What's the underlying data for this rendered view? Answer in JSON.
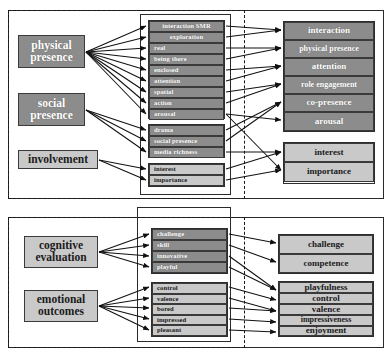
{
  "diagram": {
    "type": "path-diagram",
    "colors": {
      "dark_box": "#8c8c8c",
      "light_box": "#c9c9c9",
      "box_border": "#3a3a3a",
      "frame_solid": "#2a2a2a",
      "frame_dashed": "#1a1a1a",
      "arrow": "#111111",
      "dark_box_text": "#ffffff",
      "light_box_text": "#1b1b1b",
      "background": "#ffffff"
    }
  },
  "panels": [
    {
      "id": "top-panel",
      "latent_variables": [
        {
          "id": "physical-presence",
          "label_line1": "physical",
          "label_line2": "presence",
          "shade": "dark"
        },
        {
          "id": "social-presence",
          "label_line1": "social",
          "label_line2": "presence",
          "shade": "dark"
        },
        {
          "id": "involvement",
          "label_line1": "involvement",
          "label_line2": "",
          "shade": "light"
        }
      ],
      "indicator_groups": [
        {
          "id": "presence-indicators",
          "shade": "dark",
          "items": [
            {
              "id": "interaction-smr",
              "label": "interaction SMR"
            },
            {
              "id": "exploration",
              "label": "exploration"
            },
            {
              "id": "real",
              "label": "real"
            },
            {
              "id": "being-there",
              "label": "being there"
            },
            {
              "id": "enclosed",
              "label": "enclosed"
            },
            {
              "id": "attention",
              "label": "attention"
            },
            {
              "id": "spatial",
              "label": "spatial"
            },
            {
              "id": "action",
              "label": "action"
            },
            {
              "id": "arousal",
              "label": "arousal"
            }
          ]
        },
        {
          "id": "social-indicators",
          "shade": "dark",
          "items": [
            {
              "id": "drama",
              "label": "drama"
            },
            {
              "id": "social-presence",
              "label": "social presence"
            },
            {
              "id": "media-richness",
              "label": "media richness"
            }
          ]
        },
        {
          "id": "involvement-indicators",
          "shade": "light",
          "items": [
            {
              "id": "interest",
              "label": "interest"
            },
            {
              "id": "importance",
              "label": "importance"
            }
          ]
        }
      ],
      "outcome_groups": [
        {
          "id": "presence-factors",
          "shade": "dark",
          "items": [
            {
              "id": "interaction",
              "label": "interaction"
            },
            {
              "id": "physical-presence",
              "label": "physical presence"
            },
            {
              "id": "attention",
              "label": "attention"
            },
            {
              "id": "role-engagement",
              "label": "role engagement"
            },
            {
              "id": "co-presence",
              "label": "co-presence"
            },
            {
              "id": "arousal",
              "label": "arousal"
            }
          ]
        },
        {
          "id": "involvement-factors",
          "shade": "light",
          "items": [
            {
              "id": "interest",
              "label": "interest"
            },
            {
              "id": "importance",
              "label": "importance"
            }
          ]
        }
      ]
    },
    {
      "id": "bottom-panel",
      "latent_variables": [
        {
          "id": "cognitive-evaluation",
          "label_line1": "cognitive",
          "label_line2": "evaluation",
          "shade": "light"
        },
        {
          "id": "emotional-outcomes",
          "label_line1": "emotional",
          "label_line2": "outcomes",
          "shade": "light"
        }
      ],
      "indicator_groups": [
        {
          "id": "cognitive-indicators",
          "shade": "dark",
          "items": [
            {
              "id": "challenge",
              "label": "challenge"
            },
            {
              "id": "skill",
              "label": "skill"
            },
            {
              "id": "innovative",
              "label": "innovative"
            },
            {
              "id": "playful",
              "label": "playful"
            }
          ]
        },
        {
          "id": "emotional-indicators",
          "shade": "light",
          "items": [
            {
              "id": "control",
              "label": "control"
            },
            {
              "id": "valence",
              "label": "valence"
            },
            {
              "id": "bored",
              "label": "bored"
            },
            {
              "id": "impressed",
              "label": "impressed"
            },
            {
              "id": "pleasant",
              "label": "pleasant"
            }
          ]
        }
      ],
      "outcome_groups": [
        {
          "id": "cognitive-factors",
          "shade": "light",
          "items": [
            {
              "id": "challenge",
              "label": "challenge"
            },
            {
              "id": "competence",
              "label": "competence"
            }
          ]
        },
        {
          "id": "emotional-factors",
          "shade": "light",
          "items": [
            {
              "id": "playfulness",
              "label": "playfulness"
            },
            {
              "id": "control",
              "label": "control"
            },
            {
              "id": "valence",
              "label": "valence"
            },
            {
              "id": "impressiveness",
              "label": "impressiveness"
            },
            {
              "id": "enjoyment",
              "label": "enjoyment"
            }
          ]
        }
      ]
    }
  ]
}
